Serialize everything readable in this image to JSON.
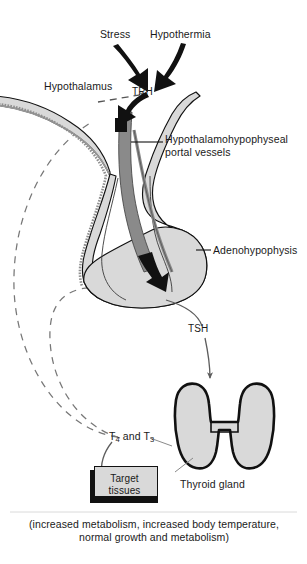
{
  "figure": {
    "background": "#ffffff",
    "width": 307,
    "height": 564
  },
  "colors": {
    "outline": "#111111",
    "tissue_fill": "#d9d9d9",
    "portal_vessel_fill": "#8a8a8a",
    "stalk_fill": "#c8c8c8",
    "arrow_black": "#111111",
    "arrow_gray": "#6e6e6e",
    "feedback_dash": "#777777",
    "text": "#1a1a1a"
  },
  "labels": {
    "stress": "Stress",
    "hypothermia": "Hypothermia",
    "hypothalamus": "Hypothalamus",
    "trh": "TRH",
    "portal_vessels": "Hypothalamohypophyseal portal vessels",
    "adenohypophysis": "Adenohypophysis",
    "tsh": "TSH",
    "thyroid_gland": "Thyroid gland",
    "thyroid_hormones_prefix": "T",
    "thyroid_hormones_sub1": "4",
    "thyroid_hormones_mid": " and T",
    "thyroid_hormones_sub2": "3",
    "target_tissues_line1": "Target",
    "target_tissues_line2": "tissues",
    "caption": "(increased metabolism, increased body temperature, normal growth and metabolism)"
  },
  "structures": [
    {
      "name": "hypothalamus",
      "kind": "tissue-band",
      "fill": "#d9d9d9"
    },
    {
      "name": "pituitary-stalk",
      "kind": "tissue",
      "fill": "#d9d9d9"
    },
    {
      "name": "adenohypophysis",
      "kind": "tissue-bulb",
      "fill": "#d9d9d9"
    },
    {
      "name": "portal-vessels",
      "kind": "vessel",
      "fill": "#8a8a8a"
    },
    {
      "name": "thyroid-gland",
      "kind": "tissue-bilobed",
      "fill": "#d9d9d9"
    },
    {
      "name": "target-tissues-box",
      "kind": "box",
      "fill": "#d9d9d9"
    }
  ],
  "flows": [
    {
      "name": "stress-to-trh",
      "from": "Stress",
      "to": "TRH",
      "style": "thick-black-arrow"
    },
    {
      "name": "hypothermia-to-trh",
      "from": "Hypothermia",
      "to": "TRH",
      "style": "thick-black-arrow"
    },
    {
      "name": "trh-into-portal",
      "from": "TRH",
      "to": "portal vessels",
      "style": "thick-black-arrow"
    },
    {
      "name": "portal-to-adenohypophysis",
      "from": "portal vessels",
      "to": "Adenohypophysis",
      "style": "thick-black-arrow"
    },
    {
      "name": "adenohypophysis-to-thyroid",
      "from": "Adenohypophysis",
      "to": "Thyroid gland",
      "label": "TSH",
      "style": "thin-gray-arrow"
    },
    {
      "name": "thyroid-to-target",
      "from": "Thyroid gland",
      "to": "Target tissues",
      "label": "T4 and T3",
      "style": "thin-gray-arrow"
    },
    {
      "name": "feedback-to-hypothalamus",
      "from": "T4 and T3",
      "to": "Hypothalamus",
      "style": "dashed-negative-feedback"
    },
    {
      "name": "feedback-to-adenohypophysis",
      "from": "T4 and T3",
      "to": "Adenohypophysis",
      "style": "dashed-negative-feedback"
    }
  ]
}
